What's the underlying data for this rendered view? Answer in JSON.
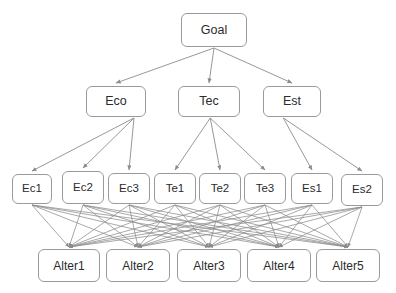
{
  "diagram": {
    "style": {
      "box_border_color": "#9a9a9a",
      "box_fill_color": "#ffffff",
      "edge_color": "#8c8c8c",
      "text_color": "#2b2b2b",
      "background_color": "#ffffff"
    },
    "levels": [
      {
        "name": "goal",
        "nodes": [
          {
            "id": "goal",
            "label": "Goal",
            "x": 181,
            "y": 13,
            "w": 66,
            "h": 34
          }
        ]
      },
      {
        "name": "criteria",
        "nodes": [
          {
            "id": "eco",
            "label": "Eco",
            "x": 86,
            "y": 86,
            "w": 60,
            "h": 31
          },
          {
            "id": "tec",
            "label": "Tec",
            "x": 178,
            "y": 86,
            "w": 62,
            "h": 31
          },
          {
            "id": "est",
            "label": "Est",
            "x": 263,
            "y": 86,
            "w": 58,
            "h": 31
          }
        ]
      },
      {
        "name": "subcriteria",
        "nodes": [
          {
            "id": "ec1",
            "label": "Ec1",
            "x": 12,
            "y": 174,
            "w": 40,
            "h": 30
          },
          {
            "id": "ec2",
            "label": "Ec2",
            "x": 62,
            "y": 171,
            "w": 42,
            "h": 33
          },
          {
            "id": "ec3",
            "label": "Ec3",
            "x": 108,
            "y": 173,
            "w": 42,
            "h": 31
          },
          {
            "id": "te1",
            "label": "Te1",
            "x": 154,
            "y": 173,
            "w": 42,
            "h": 31
          },
          {
            "id": "te2",
            "label": "Te2",
            "x": 199,
            "y": 173,
            "w": 42,
            "h": 31
          },
          {
            "id": "te3",
            "label": "Te3",
            "x": 244,
            "y": 173,
            "w": 42,
            "h": 31
          },
          {
            "id": "es1",
            "label": "Es1",
            "x": 291,
            "y": 173,
            "w": 42,
            "h": 31
          },
          {
            "id": "es2",
            "label": "Es2",
            "x": 341,
            "y": 174,
            "w": 42,
            "h": 32
          }
        ]
      },
      {
        "name": "alternatives",
        "nodes": [
          {
            "id": "alter1",
            "label": "Alter1",
            "x": 38,
            "y": 249,
            "w": 62,
            "h": 33
          },
          {
            "id": "alter2",
            "label": "Alter2",
            "x": 106,
            "y": 249,
            "w": 64,
            "h": 33
          },
          {
            "id": "alter3",
            "label": "Alter3",
            "x": 177,
            "y": 249,
            "w": 64,
            "h": 33
          },
          {
            "id": "alter4",
            "label": "Alter4",
            "x": 247,
            "y": 249,
            "w": 64,
            "h": 33
          },
          {
            "id": "alter5",
            "label": "Alter5",
            "x": 316,
            "y": 249,
            "w": 64,
            "h": 33
          }
        ]
      }
    ],
    "edges": {
      "goal_to_criteria": [
        {
          "from": "goal",
          "to": "eco"
        },
        {
          "from": "goal",
          "to": "tec"
        },
        {
          "from": "goal",
          "to": "est"
        }
      ],
      "criteria_to_subcriteria": [
        {
          "from": "eco",
          "to": "ec1"
        },
        {
          "from": "eco",
          "to": "ec2"
        },
        {
          "from": "eco",
          "to": "ec3"
        },
        {
          "from": "tec",
          "to": "te1"
        },
        {
          "from": "tec",
          "to": "te2"
        },
        {
          "from": "tec",
          "to": "te3"
        },
        {
          "from": "est",
          "to": "es1"
        },
        {
          "from": "est",
          "to": "es2"
        }
      ],
      "subcriteria_to_alternatives_complete_bipartite": true,
      "subcriteria_source_order": [
        "ec1",
        "ec2",
        "ec3",
        "te1",
        "te2",
        "te3",
        "es1",
        "es2"
      ],
      "alternatives_target_order": [
        "alter1",
        "alter2",
        "alter3",
        "alter4",
        "alter5"
      ]
    }
  }
}
